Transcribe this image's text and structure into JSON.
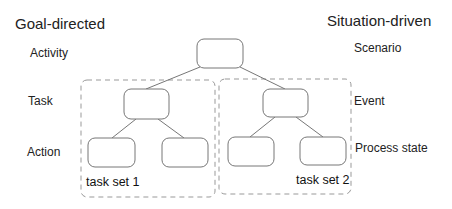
{
  "left_heading": "Goal-directed",
  "right_heading": "Situation-driven",
  "left_levels": [
    "Activity",
    "Task",
    "Action"
  ],
  "right_levels": [
    "Scenario",
    "Event",
    "Process state"
  ],
  "task_sets": [
    "task set 1",
    "task set 2"
  ],
  "colors": {
    "node_stroke": "#777777",
    "edge_stroke": "#777777",
    "dashed_stroke": "#999999",
    "text": "#222222"
  }
}
